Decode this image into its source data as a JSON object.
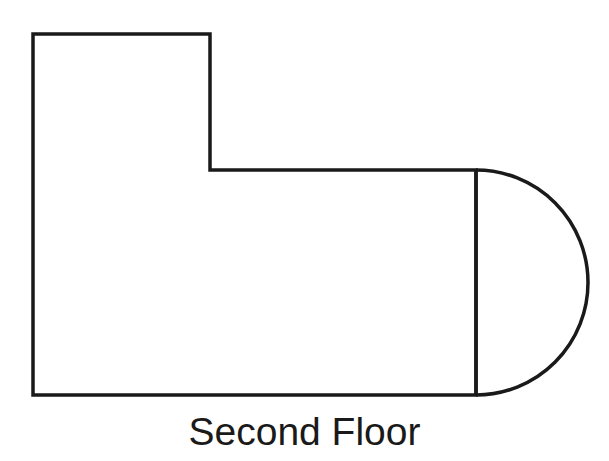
{
  "diagram": {
    "title": "Second Floor",
    "stroke_color": "#1a1a1a",
    "background": "#ffffff",
    "shapes": [
      {
        "name": "l-shaped-room",
        "type": "polygon",
        "points": [
          [
            33,
            34
          ],
          [
            210,
            34
          ],
          [
            210,
            170
          ],
          [
            476,
            170
          ],
          [
            476,
            395
          ],
          [
            33,
            395
          ]
        ]
      },
      {
        "name": "semicircle-bay",
        "type": "half-circle",
        "center": [
          476,
          282
        ],
        "radius": 112,
        "side": "right"
      },
      {
        "name": "divider-line",
        "type": "line",
        "from": [
          476,
          170
        ],
        "to": [
          476,
          395
        ]
      }
    ]
  }
}
